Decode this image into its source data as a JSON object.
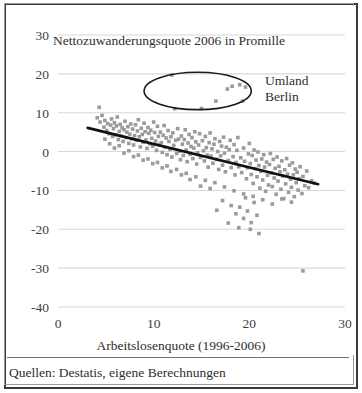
{
  "figure": {
    "source_note": "Quellen: Destatis, eigene Berechnungen"
  },
  "chart_data": {
    "type": "scatter",
    "title": "Nettozuwanderungsquote 2006 in Promille",
    "xlabel": "Arbeitslosenquote (1996-2006)",
    "ylabel": "",
    "xlim": [
      0,
      30
    ],
    "ylim": [
      -40,
      30
    ],
    "xticks": [
      0,
      10,
      20,
      30
    ],
    "yticks": [
      30,
      20,
      10,
      0,
      -10,
      -20,
      -30,
      -40
    ],
    "xtick_labels": [
      "0",
      "10",
      "20",
      "30"
    ],
    "ytick_labels": [
      "30",
      "20",
      "10",
      "0",
      "-10",
      "-20",
      "-30",
      "-40"
    ],
    "grid": "horizontal",
    "legend": "none",
    "marker": {
      "shape": "square",
      "color": "#9b9b9b",
      "size": 3.6
    },
    "annotations": [
      {
        "type": "ellipse",
        "label": "Umland Berlin",
        "label_lines": [
          "Umland",
          "Berlin"
        ],
        "center_x": 14.6,
        "center_y": 15.6,
        "radius_x": 5.6,
        "radius_y": 4.8,
        "stroke": "#1a1a1a"
      }
    ],
    "trendline": {
      "type": "linear",
      "x_start": 3.1,
      "y_start": 6.1,
      "x_end": 27.2,
      "y_end": -8.4,
      "color": "#111111",
      "width": 2.6
    },
    "points": [
      [
        4.3,
        11.4
      ],
      [
        12.2,
        11.0
      ],
      [
        11.9,
        19.7
      ],
      [
        16.5,
        13.0
      ],
      [
        15.0,
        11.1
      ],
      [
        17.7,
        16.1
      ],
      [
        18.2,
        16.8
      ],
      [
        19.0,
        17.2
      ],
      [
        19.6,
        16.6
      ],
      [
        19.3,
        13.0
      ],
      [
        4.1,
        8.7
      ],
      [
        4.4,
        7.6
      ],
      [
        4.6,
        9.3
      ],
      [
        4.8,
        6.3
      ],
      [
        4.9,
        8.0
      ],
      [
        5.1,
        5.4
      ],
      [
        5.2,
        7.2
      ],
      [
        5.3,
        4.6
      ],
      [
        5.5,
        6.8
      ],
      [
        5.6,
        8.4
      ],
      [
        5.7,
        3.9
      ],
      [
        5.8,
        5.9
      ],
      [
        5.9,
        7.4
      ],
      [
        6.0,
        4.3
      ],
      [
        6.1,
        6.6
      ],
      [
        6.2,
        8.9
      ],
      [
        6.3,
        3.1
      ],
      [
        6.4,
        5.2
      ],
      [
        6.5,
        7.0
      ],
      [
        6.6,
        4.0
      ],
      [
        6.7,
        6.1
      ],
      [
        6.8,
        2.6
      ],
      [
        6.9,
        5.6
      ],
      [
        7.0,
        7.8
      ],
      [
        7.1,
        3.6
      ],
      [
        7.2,
        5.0
      ],
      [
        7.3,
        6.4
      ],
      [
        7.4,
        2.1
      ],
      [
        7.5,
        4.5
      ],
      [
        7.6,
        7.1
      ],
      [
        7.7,
        3.3
      ],
      [
        7.8,
        5.8
      ],
      [
        7.9,
        1.7
      ],
      [
        8.0,
        4.1
      ],
      [
        8.1,
        6.9
      ],
      [
        8.2,
        2.9
      ],
      [
        8.3,
        5.3
      ],
      [
        8.4,
        8.2
      ],
      [
        8.5,
        3.8
      ],
      [
        8.6,
        1.2
      ],
      [
        8.7,
        6.0
      ],
      [
        8.8,
        4.4
      ],
      [
        8.9,
        2.4
      ],
      [
        9.0,
        7.3
      ],
      [
        9.1,
        5.1
      ],
      [
        9.2,
        3.0
      ],
      [
        9.3,
        0.8
      ],
      [
        9.4,
        6.2
      ],
      [
        9.5,
        4.7
      ],
      [
        9.6,
        2.0
      ],
      [
        9.7,
        5.5
      ],
      [
        9.8,
        3.4
      ],
      [
        9.9,
        1.4
      ],
      [
        10.0,
        7.6
      ],
      [
        10.1,
        4.9
      ],
      [
        10.2,
        2.7
      ],
      [
        10.3,
        0.3
      ],
      [
        10.4,
        6.5
      ],
      [
        10.5,
        3.9
      ],
      [
        10.6,
        1.8
      ],
      [
        10.7,
        5.0
      ],
      [
        10.8,
        2.3
      ],
      [
        10.9,
        -0.2
      ],
      [
        11.0,
        4.2
      ],
      [
        11.1,
        6.7
      ],
      [
        11.2,
        1.1
      ],
      [
        11.3,
        3.5
      ],
      [
        11.4,
        -0.8
      ],
      [
        11.5,
        5.4
      ],
      [
        11.6,
        2.6
      ],
      [
        11.7,
        0.6
      ],
      [
        11.8,
        3.8
      ],
      [
        11.9,
        -1.4
      ],
      [
        12.0,
        4.8
      ],
      [
        12.1,
        1.6
      ],
      [
        12.3,
        2.9
      ],
      [
        12.4,
        -0.5
      ],
      [
        12.5,
        5.9
      ],
      [
        12.6,
        3.2
      ],
      [
        12.7,
        0.1
      ],
      [
        12.8,
        -2.1
      ],
      [
        12.9,
        4.0
      ],
      [
        13.0,
        1.9
      ],
      [
        13.1,
        -1.0
      ],
      [
        13.2,
        3.1
      ],
      [
        13.3,
        5.6
      ],
      [
        13.4,
        0.4
      ],
      [
        13.5,
        -2.6
      ],
      [
        13.6,
        2.2
      ],
      [
        13.7,
        4.4
      ],
      [
        13.8,
        -0.7
      ],
      [
        13.9,
        1.3
      ],
      [
        14.0,
        3.6
      ],
      [
        14.1,
        -1.8
      ],
      [
        14.2,
        0.9
      ],
      [
        14.3,
        5.1
      ],
      [
        14.4,
        2.5
      ],
      [
        14.5,
        -3.2
      ],
      [
        14.6,
        -0.3
      ],
      [
        14.7,
        1.7
      ],
      [
        14.8,
        4.6
      ],
      [
        14.9,
        -1.5
      ],
      [
        15.1,
        2.8
      ],
      [
        15.2,
        0.2
      ],
      [
        15.3,
        -2.4
      ],
      [
        15.4,
        3.9
      ],
      [
        15.5,
        1.0
      ],
      [
        15.6,
        -0.9
      ],
      [
        15.7,
        -4.0
      ],
      [
        15.8,
        2.3
      ],
      [
        15.9,
        4.8
      ],
      [
        16.0,
        -1.2
      ],
      [
        16.1,
        0.7
      ],
      [
        16.2,
        -3.0
      ],
      [
        16.3,
        1.9
      ],
      [
        16.4,
        3.3
      ],
      [
        16.6,
        -2.0
      ],
      [
        16.7,
        0.0
      ],
      [
        16.8,
        -4.6
      ],
      [
        16.9,
        2.6
      ],
      [
        17.0,
        -1.1
      ],
      [
        17.1,
        1.4
      ],
      [
        17.2,
        -3.5
      ],
      [
        17.3,
        3.7
      ],
      [
        17.4,
        -0.4
      ],
      [
        17.5,
        -5.2
      ],
      [
        17.6,
        1.1
      ],
      [
        17.8,
        -2.3
      ],
      [
        17.9,
        0.5
      ],
      [
        18.0,
        2.9
      ],
      [
        18.1,
        -4.1
      ],
      [
        18.3,
        -1.3
      ],
      [
        18.4,
        1.8
      ],
      [
        18.5,
        -6.0
      ],
      [
        18.6,
        -2.8
      ],
      [
        18.7,
        0.3
      ],
      [
        18.8,
        3.6
      ],
      [
        18.9,
        -3.9
      ],
      [
        19.1,
        -1.6
      ],
      [
        19.2,
        -5.4
      ],
      [
        19.4,
        0.9
      ],
      [
        19.5,
        -2.5
      ],
      [
        19.7,
        -7.0
      ],
      [
        19.8,
        -4.2
      ],
      [
        19.9,
        -0.6
      ],
      [
        20.0,
        2.1
      ],
      [
        20.1,
        -3.1
      ],
      [
        20.2,
        -5.9
      ],
      [
        20.3,
        -1.0
      ],
      [
        20.4,
        -8.2
      ],
      [
        20.5,
        0.4
      ],
      [
        20.6,
        -4.4
      ],
      [
        20.7,
        -2.2
      ],
      [
        20.8,
        -6.5
      ],
      [
        20.9,
        -0.1
      ],
      [
        21.0,
        -3.6
      ],
      [
        21.1,
        -9.4
      ],
      [
        21.2,
        -5.1
      ],
      [
        21.3,
        -1.9
      ],
      [
        21.4,
        -7.3
      ],
      [
        21.5,
        -0.8
      ],
      [
        21.6,
        -4.0
      ],
      [
        21.7,
        -10.2
      ],
      [
        21.8,
        -2.7
      ],
      [
        21.9,
        -6.1
      ],
      [
        22.0,
        -8.6
      ],
      [
        22.1,
        -3.3
      ],
      [
        22.2,
        -0.5
      ],
      [
        22.3,
        -5.5
      ],
      [
        22.4,
        -9.0
      ],
      [
        22.5,
        -2.0
      ],
      [
        22.6,
        -6.8
      ],
      [
        22.7,
        -4.3
      ],
      [
        22.8,
        -11.0
      ],
      [
        22.9,
        -1.4
      ],
      [
        23.0,
        -7.6
      ],
      [
        23.1,
        -3.8
      ],
      [
        23.2,
        -5.2
      ],
      [
        23.3,
        -9.7
      ],
      [
        23.4,
        -2.4
      ],
      [
        23.5,
        -6.3
      ],
      [
        23.6,
        -12.1
      ],
      [
        23.7,
        -4.7
      ],
      [
        23.8,
        -8.3
      ],
      [
        23.9,
        -1.8
      ],
      [
        24.0,
        -5.8
      ],
      [
        24.1,
        -10.5
      ],
      [
        24.2,
        -3.5
      ],
      [
        24.3,
        -7.1
      ],
      [
        24.4,
        -9.2
      ],
      [
        24.5,
        -2.9
      ],
      [
        24.6,
        -6.0
      ],
      [
        24.7,
        -11.6
      ],
      [
        24.8,
        -4.5
      ],
      [
        24.9,
        -8.0
      ],
      [
        25.0,
        -5.3
      ],
      [
        25.1,
        -9.9
      ],
      [
        25.2,
        -7.0
      ],
      [
        25.3,
        -3.9
      ],
      [
        25.5,
        -10.8
      ],
      [
        25.6,
        -6.4
      ],
      [
        25.8,
        -8.8
      ],
      [
        26.0,
        -5.0
      ],
      [
        26.2,
        -9.3
      ],
      [
        26.5,
        -7.5
      ],
      [
        26.8,
        -8.1
      ],
      [
        15.9,
        -9.5
      ],
      [
        16.6,
        -15.1
      ],
      [
        17.2,
        -12.6
      ],
      [
        18.1,
        -13.9
      ],
      [
        18.6,
        -16.0
      ],
      [
        19.0,
        -14.3
      ],
      [
        19.4,
        -17.2
      ],
      [
        19.8,
        -15.3
      ],
      [
        20.2,
        -18.3
      ],
      [
        20.5,
        -13.1
      ],
      [
        20.8,
        -16.4
      ],
      [
        21.0,
        -21.1
      ],
      [
        17.8,
        -18.4
      ],
      [
        18.9,
        -19.6
      ],
      [
        19.6,
        -11.9
      ],
      [
        20.1,
        -20.0
      ],
      [
        25.6,
        -30.7
      ],
      [
        14.9,
        -8.9
      ],
      [
        13.8,
        -7.2
      ],
      [
        12.9,
        -6.0
      ],
      [
        11.8,
        -5.1
      ],
      [
        10.9,
        -4.2
      ],
      [
        9.9,
        -3.1
      ],
      [
        8.9,
        -2.2
      ],
      [
        7.9,
        -1.3
      ],
      [
        6.9,
        -0.4
      ],
      [
        5.9,
        0.9
      ],
      [
        5.4,
        2.0
      ],
      [
        4.9,
        3.2
      ],
      [
        6.4,
        1.5
      ],
      [
        7.4,
        0.2
      ],
      [
        8.4,
        -0.9
      ],
      [
        9.4,
        -1.9
      ],
      [
        10.4,
        -2.8
      ],
      [
        11.4,
        -3.7
      ],
      [
        12.4,
        -4.6
      ],
      [
        13.4,
        -5.6
      ],
      [
        14.4,
        -6.5
      ],
      [
        15.4,
        -7.4
      ],
      [
        16.4,
        -8.0
      ],
      [
        17.4,
        -9.1
      ],
      [
        18.4,
        -10.1
      ],
      [
        19.4,
        -10.9
      ],
      [
        22.4,
        -13.5
      ],
      [
        23.4,
        -12.2
      ],
      [
        24.4,
        -13.0
      ],
      [
        21.4,
        -12.4
      ],
      [
        20.4,
        -11.5
      ]
    ]
  }
}
